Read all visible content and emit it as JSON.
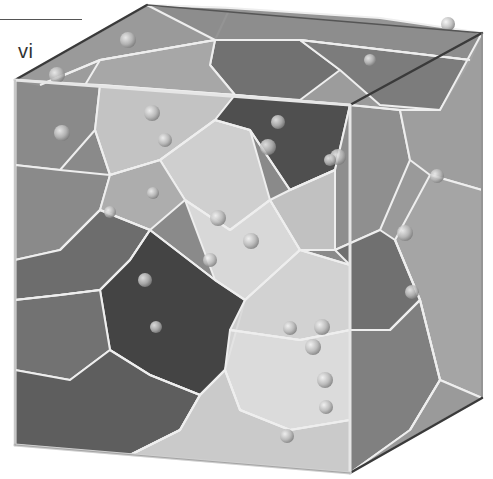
{
  "panel": {
    "label": "vi"
  },
  "diagram": {
    "type": "3d-voronoi-tessellation-in-cube",
    "colors": {
      "background": "#ffffff",
      "cube_edge_dark": "#3a3a3a",
      "cube_edge_light": "#e6e6e6",
      "cell_edge": "#eeeeee",
      "seed": "#bdbdbd"
    },
    "cube": {
      "front_top_left": [
        15,
        80
      ],
      "front_top_right": [
        350,
        105
      ],
      "front_bottom_left": [
        15,
        445
      ],
      "front_bottom_right": [
        350,
        473
      ],
      "back_top_left": [
        147,
        5
      ],
      "back_top_right": [
        482,
        33
      ],
      "back_bottom_right": [
        482,
        398
      ]
    },
    "cells": [
      {
        "points": "15,80 147,5 230,8 215,40 100,60 40,85",
        "fill": "#9a9a9a"
      },
      {
        "points": "147,5 230,8 380,18 482,33 470,60 300,40 215,40",
        "fill": "#8c8c8c"
      },
      {
        "points": "215,40 300,40 340,70 300,100 235,95 210,65",
        "fill": "#6e6e6e"
      },
      {
        "points": "300,40 470,60 440,110 380,105 340,70",
        "fill": "#7a7a7a"
      },
      {
        "points": "100,60 215,40 210,65 235,95 150,90 85,85",
        "fill": "#a8a8a8"
      },
      {
        "points": "15,80 100,85 95,130 60,170 15,165",
        "fill": "#8a8a8a"
      },
      {
        "points": "100,85 235,95 215,120 160,160 110,175 95,130",
        "fill": "#c8c8c8"
      },
      {
        "points": "160,160 215,120 250,130 270,200 230,230 185,200",
        "fill": "#d5d5d5"
      },
      {
        "points": "235,95 350,105 335,170 290,190 250,130 215,120",
        "fill": "#4a4a4a"
      },
      {
        "points": "350,105 400,110 410,160 380,230 335,250 335,170",
        "fill": "#8e8e8e"
      },
      {
        "points": "400,110 440,110 482,33 482,190 430,175 410,160",
        "fill": "#9e9e9e"
      },
      {
        "points": "430,175 482,190 482,398 440,380 420,300 395,240",
        "fill": "#a6a6a6"
      },
      {
        "points": "15,165 60,170 110,175 100,210 60,250 15,260",
        "fill": "#8a8a8a"
      },
      {
        "points": "110,175 160,160 185,200 150,230 100,210",
        "fill": "#b0b0b0"
      },
      {
        "points": "185,200 230,230 270,200 300,250 245,300 215,280",
        "fill": "#dedede"
      },
      {
        "points": "270,200 290,190 335,170 335,250 300,250",
        "fill": "#c6c6c6"
      },
      {
        "points": "15,260 60,250 100,210 150,230 130,260 100,290 60,295 15,300",
        "fill": "#6a6a6a"
      },
      {
        "points": "100,290 130,260 150,230 215,280 245,300 225,370 200,395 150,375 110,350",
        "fill": "#3e3e3e"
      },
      {
        "points": "15,300 60,295 100,290 110,350 70,380 15,370",
        "fill": "#707070"
      },
      {
        "points": "15,370 70,380 110,350 150,375 200,395 180,430 130,455 15,445",
        "fill": "#5a5a5a"
      },
      {
        "points": "245,300 300,250 350,265 350,330 300,340 230,330",
        "fill": "#d8d8d8"
      },
      {
        "points": "225,370 230,330 300,340 350,330 350,420 290,430 240,410",
        "fill": "#e2e2e2"
      },
      {
        "points": "130,455 180,430 200,395 225,370 240,410 290,430 350,420 350,473",
        "fill": "#cfcfcf"
      },
      {
        "points": "335,250 380,230 395,240 420,300 390,330 350,330 350,265",
        "fill": "#6c6c6c"
      },
      {
        "points": "350,330 390,330 420,300 440,380 410,430 350,473 350,420",
        "fill": "#7e7e7e"
      },
      {
        "points": "410,430 440,380 482,398 350,473",
        "fill": "#9a9a9a"
      }
    ],
    "seeds": [
      {
        "x": 57,
        "y": 75,
        "r": 8
      },
      {
        "x": 62,
        "y": 133,
        "r": 8
      },
      {
        "x": 152,
        "y": 113,
        "r": 8
      },
      {
        "x": 128,
        "y": 40,
        "r": 8
      },
      {
        "x": 268,
        "y": 147,
        "r": 8
      },
      {
        "x": 278,
        "y": 122,
        "r": 7
      },
      {
        "x": 338,
        "y": 157,
        "r": 8
      },
      {
        "x": 330,
        "y": 160,
        "r": 6
      },
      {
        "x": 165,
        "y": 140,
        "r": 7
      },
      {
        "x": 153,
        "y": 193,
        "r": 6
      },
      {
        "x": 110,
        "y": 212,
        "r": 6
      },
      {
        "x": 218,
        "y": 218,
        "r": 8
      },
      {
        "x": 251,
        "y": 241,
        "r": 8
      },
      {
        "x": 210,
        "y": 260,
        "r": 7
      },
      {
        "x": 145,
        "y": 280,
        "r": 7
      },
      {
        "x": 405,
        "y": 233,
        "r": 8
      },
      {
        "x": 437,
        "y": 176,
        "r": 7
      },
      {
        "x": 412,
        "y": 292,
        "r": 7
      },
      {
        "x": 322,
        "y": 327,
        "r": 8
      },
      {
        "x": 313,
        "y": 347,
        "r": 8
      },
      {
        "x": 290,
        "y": 328,
        "r": 7
      },
      {
        "x": 325,
        "y": 380,
        "r": 8
      },
      {
        "x": 326,
        "y": 407,
        "r": 7
      },
      {
        "x": 287,
        "y": 436,
        "r": 7
      },
      {
        "x": 156,
        "y": 327,
        "r": 6
      },
      {
        "x": 448,
        "y": 24,
        "r": 7
      },
      {
        "x": 370,
        "y": 60,
        "r": 6
      }
    ],
    "inner_edges": [
      "40,85 100,60 215,40 300,40 470,60",
      "100,85 235,95 350,105 400,110 440,110",
      "95,130 110,175 160,160 215,120 250,130 290,190 335,170",
      "60,250 100,210 150,230 215,280 245,300 300,250 350,265",
      "110,350 150,375 200,395 225,370 240,410 290,430 350,420",
      "130,455 180,430 200,395",
      "15,300 60,295 100,290 130,260 150,230",
      "395,240 420,300 390,330 350,330",
      "410,430 440,380 420,300",
      "185,200 230,230 270,200 300,250",
      "230,330 300,340 350,330"
    ]
  }
}
